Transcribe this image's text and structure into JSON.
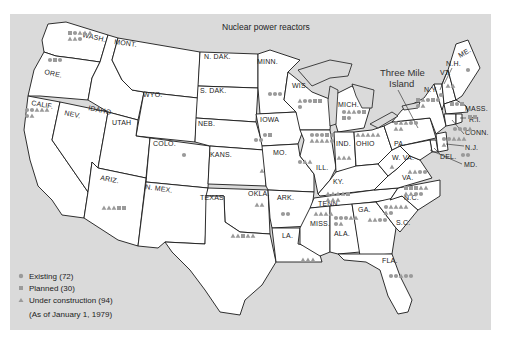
{
  "title": "Nuclear power reactors",
  "callout": {
    "line1": "Three Mile",
    "line2": "Island"
  },
  "colors": {
    "background": "#dadada",
    "land": "#ffffff",
    "marker": "#9a9a9a",
    "border": "#1a1a1a"
  },
  "legend": {
    "items": [
      {
        "symbol": "circle",
        "label": "Existing (72)"
      },
      {
        "symbol": "square",
        "label": "Planned (30)"
      },
      {
        "symbol": "triangle",
        "label": "Under construction (94)"
      }
    ],
    "note": "(As of January 1, 1979)"
  },
  "state_labels": [
    {
      "id": "wash",
      "text": "WASH."
    },
    {
      "id": "ore",
      "text": "ORE."
    },
    {
      "id": "calif",
      "text": "CALIF."
    },
    {
      "id": "nev",
      "text": "NEV."
    },
    {
      "id": "idaho",
      "text": "IDAHO"
    },
    {
      "id": "mont",
      "text": "MONT."
    },
    {
      "id": "wyo",
      "text": "WYO."
    },
    {
      "id": "utah",
      "text": "UTAH"
    },
    {
      "id": "colo",
      "text": "COLO."
    },
    {
      "id": "ariz",
      "text": "ARIZ."
    },
    {
      "id": "nmex",
      "text": "N. MEX."
    },
    {
      "id": "ndak",
      "text": "N. DAK."
    },
    {
      "id": "sdak",
      "text": "S. DAK."
    },
    {
      "id": "neb",
      "text": "NEB."
    },
    {
      "id": "kans",
      "text": "KANS."
    },
    {
      "id": "okla",
      "text": "OKLA."
    },
    {
      "id": "texas",
      "text": "TEXAS"
    },
    {
      "id": "minn",
      "text": "MINN."
    },
    {
      "id": "iowa",
      "text": "IOWA"
    },
    {
      "id": "mo",
      "text": "MO."
    },
    {
      "id": "ark",
      "text": "ARK."
    },
    {
      "id": "la",
      "text": "LA."
    },
    {
      "id": "wis",
      "text": "WIS."
    },
    {
      "id": "ill",
      "text": "ILL."
    },
    {
      "id": "mich",
      "text": "MICH."
    },
    {
      "id": "ind",
      "text": "IND."
    },
    {
      "id": "ohio",
      "text": "OHIO"
    },
    {
      "id": "ky",
      "text": "KY."
    },
    {
      "id": "tenn",
      "text": "TENN."
    },
    {
      "id": "miss",
      "text": "MISS."
    },
    {
      "id": "ala",
      "text": "ALA."
    },
    {
      "id": "ga",
      "text": "GA."
    },
    {
      "id": "fla",
      "text": "FLA."
    },
    {
      "id": "sc",
      "text": "S.C."
    },
    {
      "id": "nc",
      "text": "N.C."
    },
    {
      "id": "va",
      "text": "VA."
    },
    {
      "id": "wva",
      "text": "W. VA."
    },
    {
      "id": "pa",
      "text": "PA."
    },
    {
      "id": "ny",
      "text": "N.Y."
    },
    {
      "id": "me",
      "text": "ME."
    },
    {
      "id": "nh",
      "text": "N.H."
    },
    {
      "id": "vt",
      "text": "VT."
    },
    {
      "id": "mass",
      "text": "MASS."
    },
    {
      "id": "ri",
      "text": "R.I."
    },
    {
      "id": "conn",
      "text": "CONN."
    },
    {
      "id": "nj",
      "text": "N.J."
    },
    {
      "id": "del",
      "text": "DEL."
    },
    {
      "id": "md",
      "text": "MD."
    }
  ],
  "reactor_sites": [
    {
      "state": "WASH.",
      "type": "square"
    },
    {
      "state": "WASH.",
      "type": "circle"
    },
    {
      "state": "WASH.",
      "type": "triangle"
    },
    {
      "state": "WASH.",
      "type": "triangle"
    },
    {
      "state": "WASH.",
      "type": "triangle"
    },
    {
      "state": "WASH.",
      "type": "triangle"
    },
    {
      "state": "WASH.",
      "type": "triangle"
    },
    {
      "state": "WASH.",
      "type": "circle"
    },
    {
      "state": "ORE.",
      "type": "circle"
    },
    {
      "state": "ORE.",
      "type": "square"
    },
    {
      "state": "ORE.",
      "type": "circle"
    },
    {
      "state": "CALIF.",
      "type": "circle"
    },
    {
      "state": "CALIF.",
      "type": "circle"
    },
    {
      "state": "CALIF.",
      "type": "triangle"
    },
    {
      "state": "CALIF.",
      "type": "triangle"
    },
    {
      "state": "CALIF.",
      "type": "triangle"
    },
    {
      "state": "CALIF.",
      "type": "circle"
    },
    {
      "state": "CALIF.",
      "type": "triangle"
    },
    {
      "state": "ARIZ.",
      "type": "triangle"
    },
    {
      "state": "ARIZ.",
      "type": "triangle"
    },
    {
      "state": "ARIZ.",
      "type": "triangle"
    },
    {
      "state": "ARIZ.",
      "type": "square"
    },
    {
      "state": "ARIZ.",
      "type": "square"
    },
    {
      "state": "COLO.",
      "type": "circle"
    },
    {
      "state": "KANS.",
      "type": "triangle"
    },
    {
      "state": "OKLA.",
      "type": "triangle"
    },
    {
      "state": "OKLA.",
      "type": "triangle"
    },
    {
      "state": "TEXAS",
      "type": "triangle"
    },
    {
      "state": "TEXAS",
      "type": "triangle"
    },
    {
      "state": "TEXAS",
      "type": "square"
    },
    {
      "state": "TEXAS",
      "type": "triangle"
    },
    {
      "state": "TEXAS",
      "type": "triangle"
    },
    {
      "state": "NEB.",
      "type": "circle"
    },
    {
      "state": "NEB.",
      "type": "circle"
    },
    {
      "state": "MINN.",
      "type": "circle"
    },
    {
      "state": "MINN.",
      "type": "circle"
    },
    {
      "state": "MINN.",
      "type": "circle"
    },
    {
      "state": "IOWA",
      "type": "circle"
    },
    {
      "state": "IOWA",
      "type": "square"
    },
    {
      "state": "MO.",
      "type": "circle"
    },
    {
      "state": "MO.",
      "type": "triangle"
    },
    {
      "state": "MO.",
      "type": "triangle"
    },
    {
      "state": "ARK.",
      "type": "circle"
    },
    {
      "state": "ARK.",
      "type": "circle"
    },
    {
      "state": "LA.",
      "type": "triangle"
    },
    {
      "state": "LA.",
      "type": "triangle"
    },
    {
      "state": "LA.",
      "type": "triangle"
    },
    {
      "state": "WIS.",
      "type": "triangle"
    },
    {
      "state": "WIS.",
      "type": "circle"
    },
    {
      "state": "WIS.",
      "type": "circle"
    },
    {
      "state": "WIS.",
      "type": "square"
    },
    {
      "state": "WIS.",
      "type": "square"
    },
    {
      "state": "WIS.",
      "type": "circle"
    },
    {
      "state": "MICH.",
      "type": "circle"
    },
    {
      "state": "MICH.",
      "type": "triangle"
    },
    {
      "state": "MICH.",
      "type": "triangle"
    },
    {
      "state": "MICH.",
      "type": "circle"
    },
    {
      "state": "MICH.",
      "type": "square"
    },
    {
      "state": "MICH.",
      "type": "square"
    },
    {
      "state": "MICH.",
      "type": "circle"
    },
    {
      "state": "ILL.",
      "type": "circle"
    },
    {
      "state": "ILL.",
      "type": "circle"
    },
    {
      "state": "ILL.",
      "type": "circle"
    },
    {
      "state": "ILL.",
      "type": "square"
    },
    {
      "state": "ILL.",
      "type": "circle"
    },
    {
      "state": "ILL.",
      "type": "triangle"
    },
    {
      "state": "ILL.",
      "type": "triangle"
    },
    {
      "state": "ILL.",
      "type": "triangle"
    },
    {
      "state": "ILL.",
      "type": "triangle"
    },
    {
      "state": "ILL.",
      "type": "circle"
    },
    {
      "state": "IND.",
      "type": "triangle"
    },
    {
      "state": "IND.",
      "type": "triangle"
    },
    {
      "state": "IND.",
      "type": "triangle"
    },
    {
      "state": "OHIO",
      "type": "triangle"
    },
    {
      "state": "OHIO",
      "type": "triangle"
    },
    {
      "state": "OHIO",
      "type": "triangle"
    },
    {
      "state": "OHIO",
      "type": "triangle"
    },
    {
      "state": "OHIO",
      "type": "triangle"
    },
    {
      "state": "PA.",
      "type": "circle"
    },
    {
      "state": "PA.",
      "type": "triangle"
    },
    {
      "state": "PA.",
      "type": "triangle"
    },
    {
      "state": "PA.",
      "type": "circle"
    },
    {
      "state": "PA.",
      "type": "circle"
    },
    {
      "state": "PA.",
      "type": "triangle"
    },
    {
      "state": "PA.",
      "type": "triangle"
    },
    {
      "state": "N.Y.",
      "type": "square"
    },
    {
      "state": "N.Y.",
      "type": "triangle"
    },
    {
      "state": "N.Y.",
      "type": "circle"
    },
    {
      "state": "N.Y.",
      "type": "square"
    },
    {
      "state": "N.Y.",
      "type": "circle"
    },
    {
      "state": "N.Y.",
      "type": "circle"
    },
    {
      "state": "N.Y.",
      "type": "triangle"
    },
    {
      "state": "VT.",
      "type": "circle"
    },
    {
      "state": "N.H.",
      "type": "triangle"
    },
    {
      "state": "N.H.",
      "type": "triangle"
    },
    {
      "state": "ME.",
      "type": "circle"
    },
    {
      "state": "MASS.",
      "type": "square"
    },
    {
      "state": "MASS.",
      "type": "circle"
    },
    {
      "state": "MASS.",
      "type": "square"
    },
    {
      "state": "R.I.",
      "type": "square"
    },
    {
      "state": "R.I.",
      "type": "square"
    },
    {
      "state": "CONN.",
      "type": "circle"
    },
    {
      "state": "CONN.",
      "type": "circle"
    },
    {
      "state": "CONN.",
      "type": "circle"
    },
    {
      "state": "CONN.",
      "type": "triangle"
    },
    {
      "state": "N.J.",
      "type": "circle"
    },
    {
      "state": "N.J.",
      "type": "circle"
    },
    {
      "state": "N.J.",
      "type": "triangle"
    },
    {
      "state": "N.J.",
      "type": "triangle"
    },
    {
      "state": "N.J.",
      "type": "triangle"
    },
    {
      "state": "N.J.",
      "type": "triangle"
    },
    {
      "state": "MD.",
      "type": "circle"
    },
    {
      "state": "MD.",
      "type": "circle"
    },
    {
      "state": "W. VA.",
      "type": "triangle"
    },
    {
      "state": "VA.",
      "type": "triangle"
    },
    {
      "state": "VA.",
      "type": "triangle"
    },
    {
      "state": "VA.",
      "type": "circle"
    },
    {
      "state": "VA.",
      "type": "circle"
    },
    {
      "state": "TENN.",
      "type": "triangle"
    },
    {
      "state": "TENN.",
      "type": "triangle"
    },
    {
      "state": "TENN.",
      "type": "triangle"
    },
    {
      "state": "TENN.",
      "type": "triangle"
    },
    {
      "state": "TENN.",
      "type": "square"
    },
    {
      "state": "TENN.",
      "type": "triangle"
    },
    {
      "state": "TENN.",
      "type": "triangle"
    },
    {
      "state": "TENN.",
      "type": "triangle"
    },
    {
      "state": "N.C.",
      "type": "square"
    },
    {
      "state": "N.C.",
      "type": "square"
    },
    {
      "state": "N.C.",
      "type": "square"
    },
    {
      "state": "N.C.",
      "type": "triangle"
    },
    {
      "state": "N.C.",
      "type": "triangle"
    },
    {
      "state": "N.C.",
      "type": "triangle"
    },
    {
      "state": "N.C.",
      "type": "triangle"
    },
    {
      "state": "N.C.",
      "type": "circle"
    },
    {
      "state": "N.C.",
      "type": "circle"
    },
    {
      "state": "S.C.",
      "type": "circle"
    },
    {
      "state": "S.C.",
      "type": "triangle"
    },
    {
      "state": "S.C.",
      "type": "triangle"
    },
    {
      "state": "S.C.",
      "type": "triangle"
    },
    {
      "state": "S.C.",
      "type": "triangle"
    },
    {
      "state": "S.C.",
      "type": "triangle"
    },
    {
      "state": "S.C.",
      "type": "circle"
    },
    {
      "state": "GA.",
      "type": "triangle"
    },
    {
      "state": "GA.",
      "type": "triangle"
    },
    {
      "state": "GA.",
      "type": "circle"
    },
    {
      "state": "GA.",
      "type": "circle"
    },
    {
      "state": "ALA.",
      "type": "circle"
    },
    {
      "state": "ALA.",
      "type": "circle"
    },
    {
      "state": "ALA.",
      "type": "circle"
    },
    {
      "state": "ALA.",
      "type": "triangle"
    },
    {
      "state": "ALA.",
      "type": "triangle"
    },
    {
      "state": "ALA.",
      "type": "circle"
    },
    {
      "state": "ALA.",
      "type": "triangle"
    },
    {
      "state": "MISS.",
      "type": "triangle"
    },
    {
      "state": "MISS.",
      "type": "triangle"
    },
    {
      "state": "MISS.",
      "type": "triangle"
    },
    {
      "state": "MISS.",
      "type": "triangle"
    },
    {
      "state": "FLA.",
      "type": "circle"
    },
    {
      "state": "FLA.",
      "type": "circle"
    },
    {
      "state": "FLA.",
      "type": "triangle"
    },
    {
      "state": "FLA.",
      "type": "circle"
    },
    {
      "state": "FLA.",
      "type": "circle"
    }
  ]
}
